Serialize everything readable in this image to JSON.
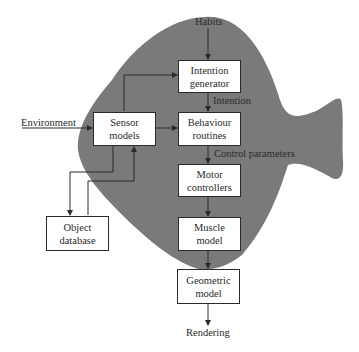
{
  "diagram": {
    "type": "flow-block-diagram",
    "background_shape": "fish-silhouette",
    "colors": {
      "fish_fill": "#7a7a7a",
      "box_fill": "#ffffff",
      "line": "#2a2a2a",
      "text": "#2a2a2a"
    },
    "nodes": {
      "intention_generator": {
        "line1": "Intention",
        "line2": "generator"
      },
      "behaviour_routines": {
        "line1": "Behaviour",
        "line2": "routines"
      },
      "motor_controllers": {
        "line1": "Motor",
        "line2": "controllers"
      },
      "muscle_model": {
        "line1": "Muscle",
        "line2": "model"
      },
      "geometric_model": {
        "line1": "Geometric",
        "line2": "model"
      },
      "sensor_models": {
        "line1": "Sensor",
        "line2": "models"
      },
      "object_database": {
        "line1": "Object",
        "line2": "database"
      }
    },
    "labels": {
      "habits": "Habits",
      "intention": "Intention",
      "control_parameters": "Control parameters",
      "environment": "Environment",
      "rendering": "Rendering"
    },
    "edges": [
      {
        "from": "Habits",
        "to": "Intention generator"
      },
      {
        "from": "Intention generator",
        "to": "Behaviour routines",
        "label": "Intention"
      },
      {
        "from": "Behaviour routines",
        "to": "Motor controllers",
        "label": "Control parameters"
      },
      {
        "from": "Motor controllers",
        "to": "Muscle model"
      },
      {
        "from": "Muscle model",
        "to": "Geometric model"
      },
      {
        "from": "Geometric model",
        "to": "Rendering"
      },
      {
        "from": "Environment",
        "to": "Sensor models"
      },
      {
        "from": "Sensor models",
        "to": "Intention generator"
      },
      {
        "from": "Sensor models",
        "to": "Behaviour routines"
      },
      {
        "from": "Sensor models",
        "to": "Object database"
      },
      {
        "from": "Object database",
        "to": "Sensor models"
      }
    ]
  }
}
